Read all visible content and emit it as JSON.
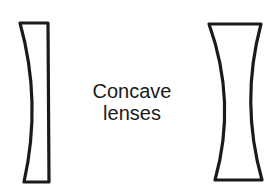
{
  "diagram": {
    "caption": {
      "line1": "Concave",
      "line2": "lenses"
    },
    "lenses": [
      {
        "name": "plano-concave-lens",
        "type": "plano-concave"
      },
      {
        "name": "biconcave-lens",
        "type": "biconcave"
      }
    ],
    "colors": {
      "stroke": "#1a1a1a",
      "background": "#ffffff"
    }
  }
}
